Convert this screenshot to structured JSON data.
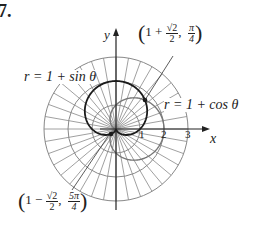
{
  "problem_number": "7.",
  "axes": {
    "x_label": "x",
    "y_label": "y",
    "ticks": [
      "1",
      "2",
      "3"
    ]
  },
  "curves": {
    "sin_cardioid": {
      "label": "r = 1 + sin θ",
      "color": "#1a1a1a"
    },
    "cos_cardioid": {
      "label": "r = 1 + cos θ",
      "color": "#777777"
    }
  },
  "points": [
    {
      "left": "1 +",
      "num": "√2",
      "den": "2",
      "sep": ",",
      "angle_num": "π",
      "angle_den": "4"
    },
    {
      "left": "1 −",
      "num": "√2",
      "den": "2",
      "sep": ",",
      "angle_num": "5π",
      "angle_den": "4"
    }
  ],
  "grid": {
    "circles": [
      1,
      2,
      3
    ],
    "radial_step_deg": 10,
    "color": "#888888"
  },
  "colors": {
    "ink": "#1a1a1a",
    "grid": "#888888"
  }
}
